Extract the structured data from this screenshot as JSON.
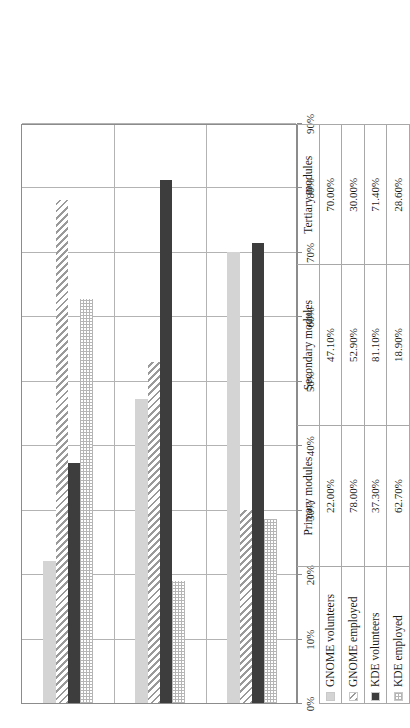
{
  "chart_data": {
    "type": "bar",
    "orientation": "horizontal",
    "title": "",
    "xlabel": "",
    "ylabel": "",
    "xlim": [
      0,
      90
    ],
    "xticks": [
      "0%",
      "10%",
      "20%",
      "30%",
      "40%",
      "50%",
      "60%",
      "70%",
      "80%",
      "90%"
    ],
    "xtick_values": [
      0,
      10,
      20,
      30,
      40,
      50,
      60,
      70,
      80,
      90
    ],
    "grid": true,
    "legend_position": "table-left-column",
    "categories": [
      "Primary modules",
      "Secondary modules",
      "Tertiary modules"
    ],
    "series": [
      {
        "name": "GNOME volunteers",
        "pattern": "solid-light",
        "color": "#d4d4d4",
        "values": [
          22.0,
          47.1,
          70.0
        ],
        "labels": [
          "22.00%",
          "47.10%",
          "70.00%"
        ]
      },
      {
        "name": "GNOME employed",
        "pattern": "diagonal-hatch",
        "color": "#9a9a9a",
        "values": [
          78.0,
          52.9,
          30.0
        ],
        "labels": [
          "78.00%",
          "52.90%",
          "30.00%"
        ]
      },
      {
        "name": "KDE volunteers",
        "pattern": "solid-dark",
        "color": "#3d3d3d",
        "values": [
          37.3,
          81.1,
          71.4
        ],
        "labels": [
          "37.30%",
          "81.10%",
          "71.40%"
        ]
      },
      {
        "name": "KDE employed",
        "pattern": "dotted-grid",
        "color": "#b5b5b5",
        "values": [
          62.7,
          18.9,
          28.6
        ],
        "labels": [
          "62.70%",
          "18.90%",
          "28.60%"
        ]
      }
    ]
  },
  "table": {
    "category_headers": [
      "Primary modules",
      "Secondary modules",
      "Tertiary modules"
    ],
    "rows": [
      {
        "label": "GNOME volunteers",
        "cells": [
          "22.00%",
          "47.10%",
          "70.00%"
        ]
      },
      {
        "label": "GNOME employed",
        "cells": [
          "78.00%",
          "52.90%",
          "30.00%"
        ]
      },
      {
        "label": "KDE volunteers",
        "cells": [
          "37.30%",
          "81.10%",
          "71.40%"
        ]
      },
      {
        "label": "KDE employed",
        "cells": [
          "62.70%",
          "18.90%",
          "28.60%"
        ]
      }
    ]
  },
  "colors": {
    "gnome_volunteers": "#d4d4d4",
    "gnome_employed": "#9a9a9a",
    "kde_volunteers": "#3d3d3d",
    "kde_employed": "#b5b5b5",
    "gridline": "#b3b3b3",
    "axis": "#8c8c8c",
    "table_border": "#a8a8a8"
  }
}
